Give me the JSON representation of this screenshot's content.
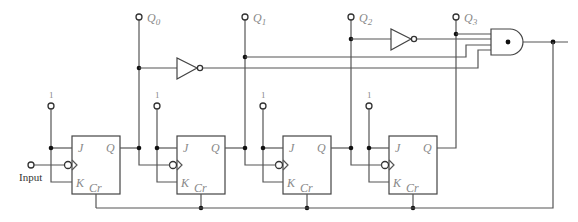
{
  "diagram": {
    "type": "circuit",
    "input": {
      "label": "Input"
    },
    "logic_one": "1",
    "outputs": [
      {
        "name": "Q",
        "sub": "0"
      },
      {
        "name": "Q",
        "sub": "1"
      },
      {
        "name": "Q",
        "sub": "2"
      },
      {
        "name": "Q",
        "sub": "3"
      }
    ],
    "flip_flops": [
      {
        "id": "FF0",
        "pins": {
          "j": "J",
          "k": "K",
          "q": "Q",
          "clear": "Cr"
        }
      },
      {
        "id": "FF1",
        "pins": {
          "j": "J",
          "k": "K",
          "q": "Q",
          "clear": "Cr"
        }
      },
      {
        "id": "FF2",
        "pins": {
          "j": "J",
          "k": "K",
          "q": "Q",
          "clear": "Cr"
        }
      },
      {
        "id": "FF3",
        "pins": {
          "j": "J",
          "k": "K",
          "q": "Q",
          "clear": "Cr"
        }
      }
    ],
    "gates": [
      {
        "type": "NOT",
        "input": "Q0"
      },
      {
        "type": "NOT",
        "input": "Q2"
      },
      {
        "type": "AND",
        "inputs": [
          "Q3",
          "NOT Q2",
          "Q1",
          "NOT Q0"
        ]
      }
    ]
  }
}
